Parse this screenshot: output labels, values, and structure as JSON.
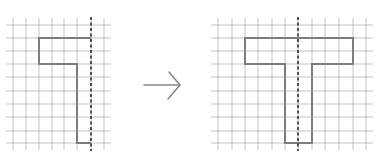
{
  "diagram": {
    "colors": {
      "background": "#ffffff",
      "grid": "#9a9a9a",
      "shape": "#7d7d7d",
      "symmetry_line": "#2e2e2e",
      "arrow": "#888888"
    },
    "left_panel": {
      "label": "half shape",
      "grid": {
        "x": [
          13,
          26,
          39,
          52,
          64,
          77,
          91,
          104
        ],
        "y": [
          25,
          38,
          51,
          64,
          77,
          91,
          104,
          117,
          131,
          143
        ]
      },
      "symmetry_line_x": 91,
      "shape_points": "91,38 39,38 39,64 77,64 77,143 91,143"
    },
    "arrow": {
      "direction": "right",
      "x1": 144,
      "x2": 180,
      "y": 85
    },
    "right_panel": {
      "label": "completed T shape",
      "grid": {
        "x": [
          218,
          232,
          245,
          258,
          272,
          285,
          298,
          312,
          325,
          339,
          353,
          366
        ],
        "y": [
          25,
          38,
          51,
          64,
          77,
          91,
          104,
          117,
          131,
          143
        ]
      },
      "symmetry_line_x": 298,
      "shape_points": "245,38 353,38 353,64 312,64 312,143 285,143 285,64 245,64"
    }
  }
}
